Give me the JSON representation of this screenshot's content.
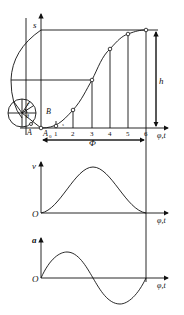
{
  "diagram": {
    "colors": {
      "line": "#111111",
      "background": "#ffffff"
    },
    "displacement": {
      "axis_label": "s",
      "x_axis_label": "φ,t",
      "height_label": "h",
      "period_label": "Φ",
      "division_labels": [
        "1",
        "2",
        "3",
        "4",
        "5",
        "6"
      ],
      "circle_labels": {
        "radius": "r",
        "angle": "θ",
        "point_B": "B",
        "point_A": "A",
        "point_A0": "A",
        "A0_sub": "0",
        "small_s": "s"
      }
    },
    "velocity": {
      "axis_label": "v",
      "origin_label": "O",
      "x_axis_label": "φ,t"
    },
    "acceleration": {
      "axis_label": "a",
      "origin_label": "O",
      "x_axis_label": "φ,t"
    }
  }
}
